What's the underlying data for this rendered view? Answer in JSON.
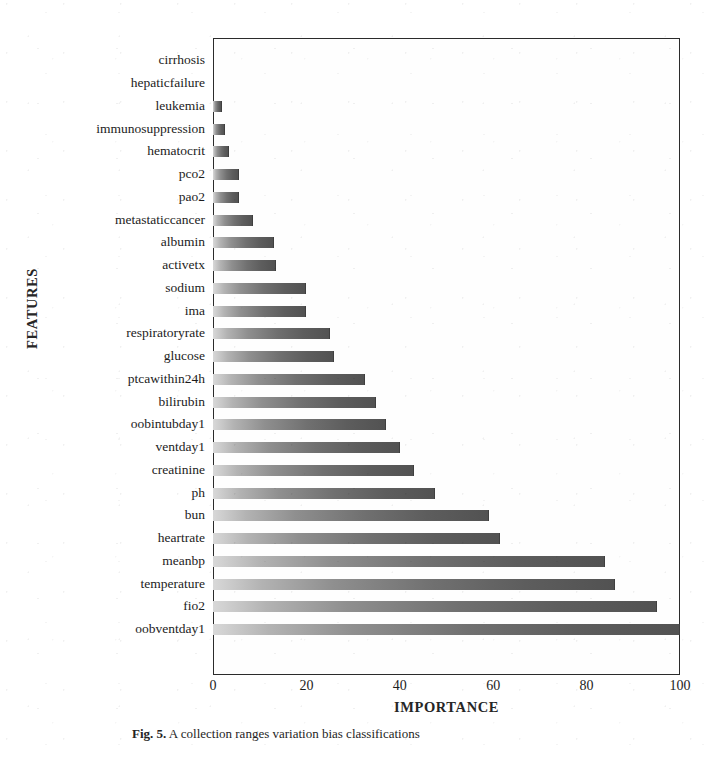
{
  "figure": {
    "y_axis_title": "FEATURES",
    "x_axis_title": "IMPORTANCE",
    "caption_label": "Fig. 5.",
    "caption_text": "A collection ranges variation bias classifications"
  },
  "chart_data": {
    "type": "bar",
    "orientation": "horizontal",
    "title": "",
    "xlabel": "IMPORTANCE",
    "ylabel": "FEATURES",
    "xlim": [
      0,
      100
    ],
    "xticks": [
      0,
      20,
      40,
      60,
      80,
      100
    ],
    "grid": false,
    "legend": null,
    "categories": [
      "cirrhosis",
      "hepaticfailure",
      "leukemia",
      "immunosuppression",
      "hematocrit",
      "pco2",
      "pao2",
      "metastaticcancer",
      "albumin",
      "activetx",
      "sodium",
      "ima",
      "respiratoryrate",
      "glucose",
      "ptcawithin24h",
      "bilirubin",
      "oobintubday1",
      "ventday1",
      "creatinine",
      "ph",
      "bun",
      "heartrate",
      "meanbp",
      "temperature",
      "fio2",
      "oobventday1"
    ],
    "values": [
      0,
      0,
      2,
      2.5,
      3.5,
      5.5,
      5.5,
      8.5,
      13,
      13.5,
      20,
      20,
      25,
      26,
      32.5,
      35,
      37,
      40,
      43,
      47.5,
      59,
      61.5,
      84,
      86,
      95,
      100
    ]
  },
  "style": {
    "bar_color_light": "#d8d8d8",
    "bar_color_dark": "#525252",
    "axis_color": "#2b2b2b",
    "text_color": "#1c1c1c",
    "background": "#ffffff"
  }
}
